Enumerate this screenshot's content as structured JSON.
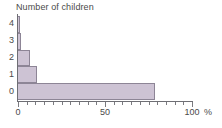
{
  "chart_data": {
    "type": "bar",
    "orientation": "horizontal",
    "title": "Number of children",
    "xlabel": "%",
    "ylabel": "Number of children",
    "categories": [
      "0",
      "1",
      "2",
      "3",
      "4"
    ],
    "values": [
      79,
      11,
      7,
      2,
      1
    ],
    "xlim": [
      0,
      100
    ],
    "x_major_ticks": [
      0,
      50,
      100
    ],
    "x_major_tick_labels": [
      "0",
      "50",
      "100"
    ],
    "x_minor_tick_step": 5,
    "y_tick_labels": [
      "0",
      "1",
      "2",
      "3",
      "4"
    ],
    "grid": false,
    "legend": false,
    "bar_fill_color": "#cdc3d4",
    "bar_border_color": "#8d8596",
    "axis_color": "#6e6e74",
    "text_color": "#4a4a4a",
    "background_color": "#ffffff"
  }
}
